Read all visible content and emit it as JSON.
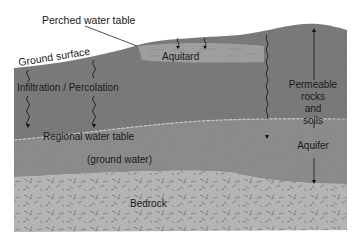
{
  "diagram": {
    "labels": {
      "perched_water_table": "Perched water table",
      "ground_surface": "Ground surface",
      "aquitard": "Aquitard",
      "infiltration": "Infiltration / Percolation",
      "regional_water_table": "Regional water table",
      "ground_water": "(ground water)",
      "bedrock": "Bedrock",
      "permeable_line1": "Permeable",
      "permeable_line2": "rocks",
      "permeable_line3": "and",
      "permeable_line4": "soils",
      "aquifer": "Aquifer"
    },
    "layers": [
      {
        "name": "Unsaturated zone (permeable rocks and soils)",
        "color": "#7d7d7d"
      },
      {
        "name": "Aquitard",
        "color": "#a8a8a8"
      },
      {
        "name": "Saturated zone (ground water)",
        "color": "#8f8f8f"
      },
      {
        "name": "Bedrock",
        "color": "#b4b4b4"
      }
    ],
    "colors": {
      "background": "#ffffff",
      "text": "#1a1a1a",
      "water_table_line": "#c4c4c4"
    }
  }
}
